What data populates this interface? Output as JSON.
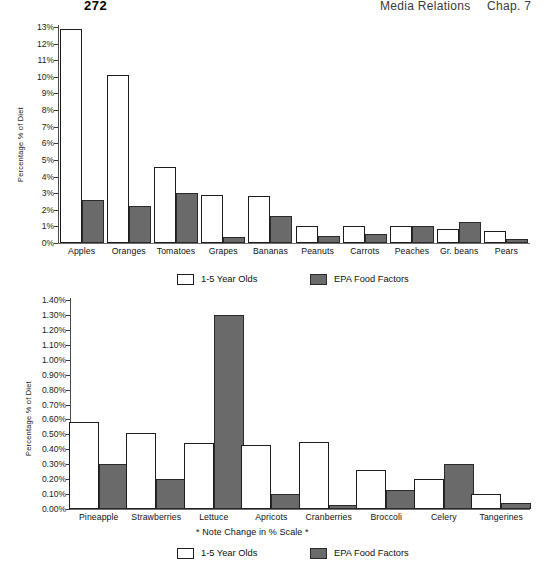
{
  "header": {
    "page_number": "272",
    "book_title": "Media Relations",
    "chapter": "Chap. 7"
  },
  "note": "* Note Change in % Scale *",
  "legend": {
    "series_white": "1-5 Year Olds",
    "series_gray": "EPA Food Factors"
  },
  "colors": {
    "series_white_fill": "#ffffff",
    "series_gray_fill": "#6a6a6a",
    "outline": "#1d1d1d",
    "text": "#101010"
  },
  "chart_data": [
    {
      "type": "bar",
      "id": "chart-top",
      "title": "",
      "xlabel": "",
      "ylabel": "Percentage % of Diet",
      "ylim": [
        0,
        13
      ],
      "ytick_labels": [
        "13%",
        "12%",
        "11%",
        "10%",
        "9%",
        "8%",
        "7%",
        "6%",
        "5%",
        "4%",
        "3%",
        "2%",
        "1%",
        "0%"
      ],
      "ytick_values": [
        13,
        12,
        11,
        10,
        9,
        8,
        7,
        6,
        5,
        4,
        3,
        2,
        1,
        0
      ],
      "grid": false,
      "legend_position": "bottom",
      "categories": [
        "Apples",
        "Oranges",
        "Tomatoes",
        "Grapes",
        "Bananas",
        "Peanuts",
        "Carrots",
        "Peaches",
        "Gr. beans",
        "Pears"
      ],
      "series": [
        {
          "name": "1-5 Year Olds",
          "values": [
            12.9,
            10.1,
            4.6,
            2.9,
            2.85,
            1.0,
            1.05,
            1.05,
            0.85,
            0.7
          ]
        },
        {
          "name": "EPA Food Factors",
          "values": [
            2.6,
            2.2,
            3.0,
            0.35,
            1.65,
            0.45,
            0.55,
            1.05,
            1.25,
            0.25
          ]
        }
      ]
    },
    {
      "type": "bar",
      "id": "chart-bottom",
      "title": "",
      "xlabel": "",
      "ylabel": "Percentage % of Diet",
      "ylim": [
        0,
        1.4
      ],
      "ytick_labels": [
        "1.40%",
        "1.30%",
        "1.20%",
        "1.10%",
        "1.00%",
        "0.90%",
        "0.80%",
        "0.70%",
        "0.60%",
        "0.50%",
        "0.40%",
        "0.30%",
        "0.20%",
        "0.10%",
        "0.00%"
      ],
      "ytick_values": [
        1.4,
        1.3,
        1.2,
        1.1,
        1.0,
        0.9,
        0.8,
        0.7,
        0.6,
        0.5,
        0.4,
        0.3,
        0.2,
        0.1,
        0.0
      ],
      "grid": false,
      "legend_position": "bottom",
      "categories": [
        "Pineapple",
        "Strawberries",
        "Lettuce",
        "Apricots",
        "Cranberries",
        "Broccoli",
        "Celery",
        "Tangerines"
      ],
      "series": [
        {
          "name": "1-5 Year Olds",
          "values": [
            0.58,
            0.51,
            0.44,
            0.43,
            0.45,
            0.26,
            0.2,
            0.1
          ]
        },
        {
          "name": "EPA Food Factors",
          "values": [
            0.3,
            0.2,
            1.3,
            0.1,
            0.03,
            0.13,
            0.3,
            0.04
          ]
        }
      ]
    }
  ]
}
